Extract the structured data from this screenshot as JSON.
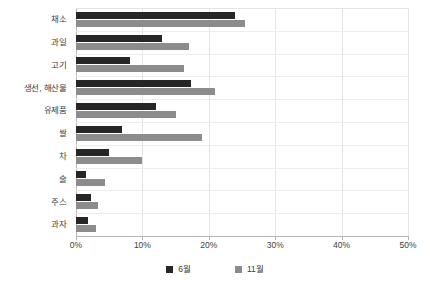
{
  "chart_data": {
    "type": "bar",
    "orientation": "horizontal",
    "title": "",
    "subtitle": "",
    "xlabel": "",
    "ylabel": "",
    "xlim": [
      0,
      50
    ],
    "xtick_labels": [
      "0%",
      "10%",
      "20%",
      "30%",
      "40%",
      "50%"
    ],
    "xtick_values": [
      0,
      10,
      20,
      30,
      40,
      50
    ],
    "grid": {
      "vertical": true,
      "horizontal": true
    },
    "legend_position": "bottom",
    "categories": [
      "채소",
      "과일",
      "고기",
      "생선, 해산물",
      "유제품",
      "쌀",
      "차",
      "술",
      "주스",
      "과자"
    ],
    "series": [
      {
        "name": "6월",
        "color": "#262626",
        "values": [
          24.0,
          13.0,
          8.1,
          17.3,
          12.0,
          7.0,
          5.0,
          1.5,
          2.2,
          1.8
        ]
      },
      {
        "name": "11월",
        "color": "#8c8c8c",
        "values": [
          25.5,
          17.0,
          16.3,
          21.0,
          15.0,
          19.0,
          10.0,
          4.3,
          3.3,
          3.0
        ]
      }
    ]
  }
}
